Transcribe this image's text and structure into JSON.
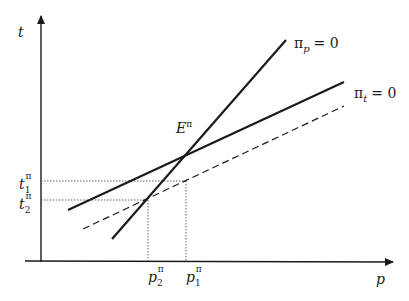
{
  "diagram": {
    "axes": {
      "x_label": "p",
      "y_label": "t"
    },
    "curves": {
      "pi_p": {
        "symbol": "π",
        "subscript": "p",
        "equals": "= 0"
      },
      "pi_t": {
        "symbol": "π",
        "subscript": "t",
        "equals": "= 0"
      },
      "dashed": {
        "label": ""
      }
    },
    "points": {
      "equilibrium": {
        "letter": "E",
        "sup": "π"
      }
    },
    "ticks": {
      "t1": {
        "base": "t",
        "sub": "1",
        "sup": "π"
      },
      "t2": {
        "base": "t",
        "sub": "2",
        "sup": "π"
      },
      "p1": {
        "base": "p",
        "sub": "1",
        "sup": "π"
      },
      "p2": {
        "base": "p",
        "sub": "2",
        "sup": "π"
      }
    },
    "colors": {
      "line": "#1a1a1a",
      "guide": "#555555"
    }
  }
}
